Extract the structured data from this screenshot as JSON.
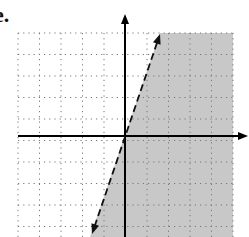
{
  "label": "e.",
  "colors": {
    "shade": "#c8c8c8",
    "grid": "#777777",
    "axis": "#000000",
    "line": "#111111"
  },
  "graph": {
    "type": "linear-inequality",
    "boundary": "dashed",
    "shaded_side": "right",
    "grid": {
      "left": 18,
      "top": 33,
      "step": 21.5,
      "cols": 10,
      "rows": 10
    },
    "axes": {
      "x_axis_y": 136,
      "y_axis_x": 125,
      "x_arrow_tip": 248,
      "y_arrow_tip": 14
    },
    "line": {
      "x1": 92,
      "y1": 234,
      "x2": 160,
      "y2": 34
    }
  }
}
